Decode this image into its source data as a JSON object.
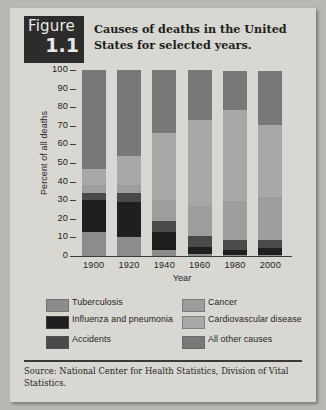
{
  "figure": {
    "badge_word": "Figure",
    "badge_number": "1.1",
    "title": "Causes of deaths in the United States for selected years."
  },
  "source_note": "Source:  National Center for Health Statistics, Division of Vital Statistics.",
  "legend": [
    {
      "label": "Tuberculosis",
      "color": "#8c8c8c"
    },
    {
      "label": "Influenza and pneumonia",
      "color": "#1f1f1f"
    },
    {
      "label": "Accidents",
      "color": "#4a4a4a"
    },
    {
      "label": "Cancer",
      "color": "#9d9d9d"
    },
    {
      "label": "Cardiovascular disease",
      "color": "#a8a8a8"
    },
    {
      "label": "All other causes",
      "color": "#787878"
    }
  ],
  "chart_data": {
    "type": "bar",
    "title": "Causes of deaths in the United States for selected years.",
    "xlabel": "Year",
    "ylabel": "Percent of all deaths",
    "ylim": [
      0,
      100
    ],
    "yticks": [
      0,
      10,
      20,
      30,
      40,
      50,
      60,
      70,
      80,
      90,
      100
    ],
    "grid": false,
    "legend_position": "bottom",
    "stacked": true,
    "stack_order_bottom_to_top": [
      "Tuberculosis",
      "Influenza and pneumonia",
      "Accidents",
      "Cancer",
      "Cardiovascular disease",
      "All other causes"
    ],
    "categories": [
      "1900",
      "1920",
      "1940",
      "1960",
      "1980",
      "2000"
    ],
    "series": [
      {
        "name": "Tuberculosis",
        "color": "#8c8c8c",
        "values": [
          13,
          10,
          3,
          1,
          0.5,
          0.5
        ]
      },
      {
        "name": "Influenza and pneumonia",
        "color": "#1f1f1f",
        "values": [
          17,
          19,
          10,
          4,
          3,
          4
        ]
      },
      {
        "name": "Accidents",
        "color": "#4a4a4a",
        "values": [
          4,
          5,
          6,
          6,
          5,
          4
        ]
      },
      {
        "name": "Cancer",
        "color": "#9d9d9d",
        "values": [
          4,
          4,
          11,
          16,
          21,
          23
        ]
      },
      {
        "name": "Cardiovascular disease",
        "color": "#a8a8a8",
        "values": [
          9,
          16,
          36,
          46,
          49,
          39
        ]
      },
      {
        "name": "All other causes",
        "color": "#787878",
        "values": [
          53,
          46,
          34,
          27,
          21,
          29
        ]
      }
    ]
  }
}
